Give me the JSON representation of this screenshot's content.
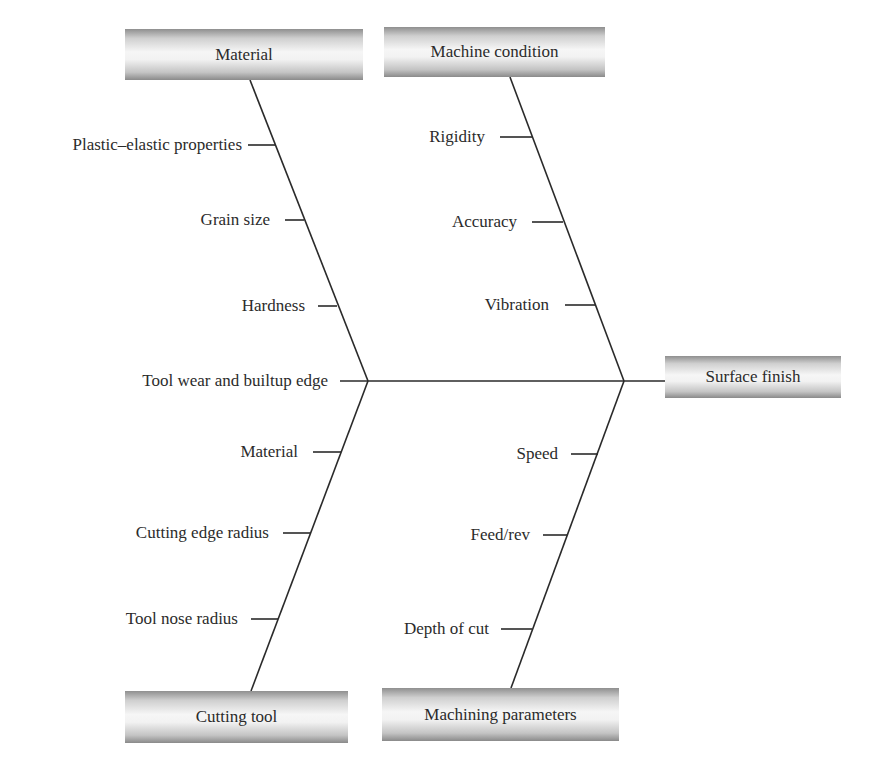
{
  "diagram": {
    "type": "fishbone",
    "effect": {
      "label": "Surface finish"
    },
    "categories": [
      {
        "label": "Material",
        "position": "top-left",
        "causes": [
          "Plastic–elastic properties",
          "Grain size",
          "Hardness"
        ]
      },
      {
        "label": "Machine condition",
        "position": "top-right",
        "causes": [
          "Rigidity",
          "Accuracy",
          "Vibration"
        ]
      },
      {
        "label": "Cutting tool",
        "position": "bottom-left",
        "causes": [
          "Material",
          "Cutting edge radius",
          "Tool nose radius"
        ]
      },
      {
        "label": "Machining parameters",
        "position": "bottom-right",
        "causes": [
          "Speed",
          "Feed/rev",
          "Depth of cut"
        ]
      }
    ],
    "spine_cause": "Tool wear and builtup edge"
  }
}
